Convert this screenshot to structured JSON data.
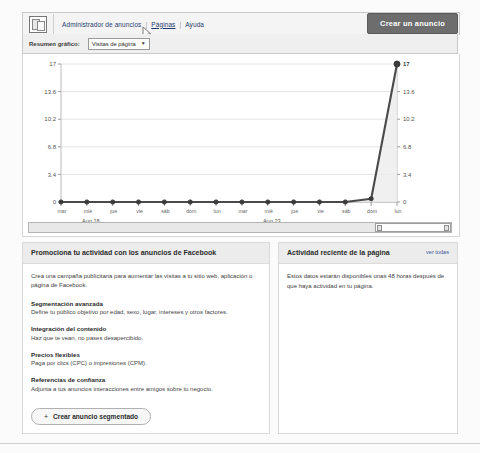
{
  "header": {
    "app_icon": "windows-icon",
    "nav": [
      {
        "label": "Administrador de anuncios",
        "active": false
      },
      {
        "label": "Páginas",
        "active": true
      },
      {
        "label": "Ayuda",
        "active": false
      }
    ],
    "divider": "|",
    "create_ad_button": "Crear un anuncio"
  },
  "graph_toolbar": {
    "label": "Resumen gráfico:",
    "selected_option": "Visitas de página",
    "arrow_icon": "chevron-down-icon"
  },
  "range": {
    "left_grip": "grip-handle",
    "right_grip": "grip-handle"
  },
  "chart_data": {
    "type": "line",
    "title": "",
    "xlabel": "",
    "ylabel": "",
    "ylim": [
      0,
      17
    ],
    "yticks": [
      0,
      3.4,
      6.8,
      10.2,
      13.6,
      17
    ],
    "ytick_labels": [
      "0",
      "3.4",
      "6.8",
      "10.2",
      "13.6",
      "17"
    ],
    "grid": true,
    "legend": "none",
    "axis_labels_mirrored": true,
    "date_anchors": [
      "Aug 18",
      "Aug 23"
    ],
    "categories": [
      "mar",
      "mié",
      "jue",
      "vie",
      "sáb",
      "dom",
      "lun",
      "mar",
      "mié",
      "jue",
      "vie",
      "sáb",
      "dom",
      "lun"
    ],
    "values": [
      0,
      0,
      0,
      0,
      0,
      0,
      0,
      0,
      0,
      0,
      0,
      0,
      0.4,
      17
    ],
    "final_point_label": "17",
    "series": [
      {
        "name": "Visitas de página",
        "values": [
          0,
          0,
          0,
          0,
          0,
          0,
          0,
          0,
          0,
          0,
          0,
          0,
          0.4,
          17
        ]
      }
    ]
  },
  "promo_panel": {
    "title": "Promociona tu actividad con los anuncios de Facebook",
    "intro": "Crea una campaña publicitaria para aumentar las visitas a tu sitio web, aplicación o página de Facebook.",
    "features": [
      {
        "title": "Segmentación avanzada",
        "desc": "Define tu público objetivo por edad, sexo, lugar, intereses y otros factores."
      },
      {
        "title": "Integración del contenido",
        "desc": "Haz que te vean, no pases desapercibido."
      },
      {
        "title": "Precios flexibles",
        "desc": "Paga por clics (CPC) o impresiones (CPM)."
      },
      {
        "title": "Referencias de confianza",
        "desc": "Adjunta a tus anuncios interacciones entre amigos sobre tu negocio."
      }
    ],
    "segment_button": {
      "plus": "+",
      "label": "Crear anuncio segmentado"
    }
  },
  "activity_panel": {
    "title": "Actividad reciente de la página",
    "link": "ver todas",
    "note": "Estos datos estarán disponibles unas 48 horas después de que haya actividad en tu página."
  },
  "colors": {
    "accent": "#3b5998",
    "button": "#6d6d6d",
    "line": "#4a4a4a",
    "panel_head": "#ececec"
  }
}
